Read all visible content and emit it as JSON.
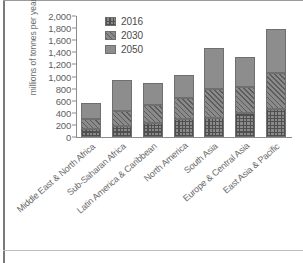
{
  "chart_data": {
    "type": "bar",
    "stacked": true,
    "title": "",
    "subtitle": "",
    "xlabel": "",
    "ylabel": "millions of tonnes per year",
    "ylim": [
      0,
      2000
    ],
    "ytick_values": [
      0,
      200,
      400,
      600,
      800,
      1000,
      1200,
      1400,
      1600,
      1800,
      2000
    ],
    "ytick_labels": [
      "0",
      "200",
      "400",
      "600",
      "800",
      "1,000",
      "1,200",
      "1,400",
      "1,600",
      "1,800",
      "2,000"
    ],
    "grid": false,
    "legend_position": "top-left",
    "categories": [
      "Middle East & North Africa",
      "Sub-Saharan Africa",
      "Latin America & Caribbean",
      "North America",
      "South Asia",
      "Europe & Central Asia",
      "East Asia & Pacific"
    ],
    "series": [
      {
        "name": "2016",
        "pattern": "crosshatch",
        "color": "#8a8a8a",
        "values": [
          140,
          185,
          225,
          305,
          320,
          395,
          470
        ]
      },
      {
        "name": "2030",
        "pattern": "diagonal-hatch",
        "color": "#8a8a8a",
        "values": [
          160,
          245,
          310,
          345,
          480,
          425,
          585
        ]
      },
      {
        "name": "2050",
        "pattern": "solid",
        "color": "#8d8d8d",
        "values": [
          260,
          520,
          350,
          380,
          670,
          500,
          725
        ]
      }
    ],
    "cumulative_tops": {
      "2016": [
        140,
        185,
        225,
        305,
        320,
        395,
        470
      ],
      "2030": [
        300,
        430,
        535,
        650,
        800,
        820,
        1055
      ],
      "2050": [
        560,
        950,
        885,
        1030,
        1470,
        1320,
        1780
      ]
    }
  },
  "legend": {
    "items": [
      {
        "label": "2016"
      },
      {
        "label": "2030"
      },
      {
        "label": "2050"
      }
    ]
  },
  "axis": {
    "y_title": "millions of tonnes per year"
  }
}
